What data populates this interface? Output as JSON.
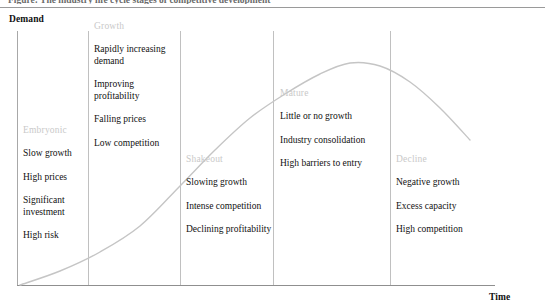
{
  "figure": {
    "clipped_caption": "Figure: The industry life cycle stages of competitive development",
    "y_axis_label": "Demand",
    "x_axis_label": "Time"
  },
  "colors": {
    "curve": "#c5c5c5",
    "stage_title": "#c9c9c9",
    "body_text": "#111111",
    "divider": "#c0c0c0",
    "axis": "#8f8f8f",
    "background": "#ffffff"
  },
  "stages": [
    {
      "id": "embryonic",
      "title": "Embryonic",
      "items": [
        "Slow growth",
        "High prices",
        "Significant investment",
        "High risk"
      ]
    },
    {
      "id": "growth",
      "title": "Growth",
      "items": [
        "Rapidly increasing demand",
        "Improving profitability",
        "Falling prices",
        "Low competition"
      ]
    },
    {
      "id": "shakeout",
      "title": "Shakeout",
      "items": [
        "Slowing growth",
        "Intense competition",
        "Declining profitability"
      ]
    },
    {
      "id": "mature",
      "title": "Mature",
      "items": [
        "Little or no growth",
        "Industry consolidation",
        "High barriers to entry"
      ]
    },
    {
      "id": "decline",
      "title": "Decline",
      "items": [
        "Negative growth",
        "Excess capacity",
        "High competition"
      ]
    }
  ],
  "chart_data": {
    "type": "line",
    "title": "Industry Life Cycle",
    "xlabel": "Time",
    "ylabel": "Demand",
    "grid": false,
    "legend": "none",
    "categories": [
      "Embryonic",
      "Growth",
      "Shakeout",
      "Mature",
      "Decline"
    ],
    "stage_boundaries_x": [
      17,
      88,
      180,
      273,
      390,
      495
    ],
    "series": [
      {
        "name": "Demand",
        "comment": "S-shaped life-cycle curve: slow start, steep growth, peak in Mature, decline",
        "x": [
          20,
          60,
          100,
          140,
          180,
          215,
          250,
          285,
          320,
          350,
          380,
          410,
          440,
          470
        ],
        "y": [
          285,
          271,
          252,
          226,
          186,
          150,
          118,
          94,
          74,
          63,
          66,
          82,
          108,
          140
        ]
      }
    ],
    "xlim": [
      17,
      495
    ],
    "ylim_pixels": [
      285,
      31
    ],
    "peak": {
      "x": 350,
      "y": 63,
      "stage": "Mature"
    }
  }
}
